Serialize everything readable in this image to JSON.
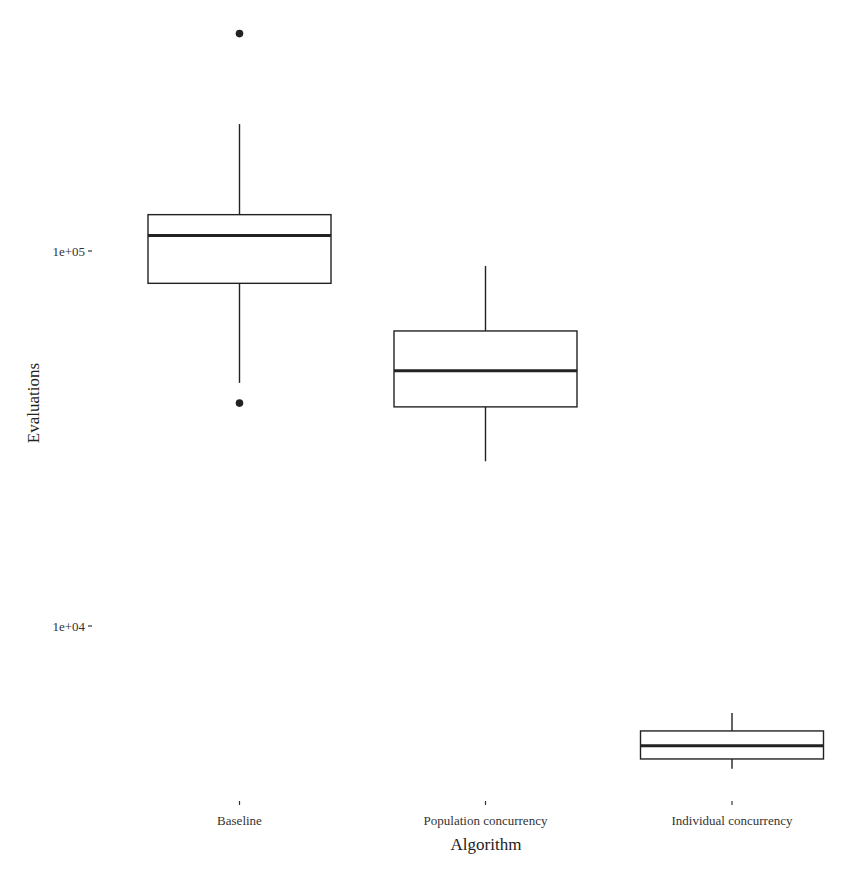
{
  "chart_data": {
    "type": "box",
    "title": "",
    "xlabel": "Algorithm",
    "ylabel": "Evaluations",
    "y_scale": "log10",
    "ylim": [
      3900,
      420000
    ],
    "y_ticks": [
      {
        "value": 100000,
        "label": "1e+05"
      },
      {
        "value": 10000,
        "label": "1e+04"
      }
    ],
    "grid": false,
    "legend": null,
    "categories": [
      "Baseline",
      "Population concurrency",
      "Individual concurrency"
    ],
    "boxes": [
      {
        "name": "Baseline",
        "whisker_low": 44500,
        "q1": 82000,
        "median": 110000,
        "q3": 125000,
        "whisker_high": 218000,
        "outliers": [
          39300,
          380000
        ]
      },
      {
        "name": "Population concurrency",
        "whisker_low": 27500,
        "q1": 38400,
        "median": 47900,
        "q3": 61200,
        "whisker_high": 91200,
        "outliers": []
      },
      {
        "name": "Individual concurrency",
        "whisker_low": 4160,
        "q1": 4420,
        "median": 4790,
        "q3": 5250,
        "whisker_high": 5860,
        "outliers": []
      }
    ],
    "colors": {
      "box_line": "#222222",
      "box_fill": "#ffffff",
      "background": "#ffffff"
    }
  }
}
